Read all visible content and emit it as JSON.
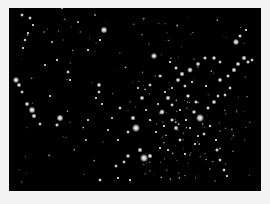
{
  "image": {
    "subject": "United States at night from space",
    "background_color": "#f4f4f4",
    "photo_color": "#000000",
    "light_color": "#ffffff"
  },
  "lights": [
    [
      22,
      15,
      1.2
    ],
    [
      30,
      18,
      1.2
    ],
    [
      33,
      25,
      1.0
    ],
    [
      28,
      33,
      1.0
    ],
    [
      25,
      40,
      1.1
    ],
    [
      23,
      48,
      1.0
    ],
    [
      16,
      80,
      2.0
    ],
    [
      19,
      85,
      1.5
    ],
    [
      22,
      92,
      1.2
    ],
    [
      27,
      104,
      1.5
    ],
    [
      32,
      110,
      2.2
    ],
    [
      34,
      116,
      1.6
    ],
    [
      40,
      124,
      1.2
    ],
    [
      60,
      118,
      2.2
    ],
    [
      57,
      125,
      1.3
    ],
    [
      50,
      96,
      1.0
    ],
    [
      45,
      65,
      0.9
    ],
    [
      57,
      60,
      1.0
    ],
    [
      52,
      42,
      0.8
    ],
    [
      104,
      30,
      2.2
    ],
    [
      100,
      40,
      1.0
    ],
    [
      78,
      22,
      0.8
    ],
    [
      95,
      15,
      0.7
    ],
    [
      62,
      8,
      0.8
    ],
    [
      88,
      50,
      1.0
    ],
    [
      68,
      72,
      1.2
    ],
    [
      70,
      80,
      1.0
    ],
    [
      99,
      85,
      1.5
    ],
    [
      99,
      92,
      1.2
    ],
    [
      96,
      98,
      1.0
    ],
    [
      88,
      120,
      1.0
    ],
    [
      86,
      140,
      0.8
    ],
    [
      102,
      104,
      1.0
    ],
    [
      120,
      108,
      1.2
    ],
    [
      133,
      118,
      1.6
    ],
    [
      136,
      128,
      2.6
    ],
    [
      128,
      132,
      1.2
    ],
    [
      150,
      85,
      1.2
    ],
    [
      142,
      98,
      1.5
    ],
    [
      154,
      56,
      2.0
    ],
    [
      170,
      62,
      1.0
    ],
    [
      176,
      68,
      1.3
    ],
    [
      182,
      74,
      1.6
    ],
    [
      190,
      70,
      1.8
    ],
    [
      198,
      64,
      1.5
    ],
    [
      205,
      58,
      1.3
    ],
    [
      178,
      80,
      1.5
    ],
    [
      185,
      86,
      1.2
    ],
    [
      168,
      98,
      1.6
    ],
    [
      172,
      105,
      1.2
    ],
    [
      162,
      112,
      1.8
    ],
    [
      172,
      120,
      1.3
    ],
    [
      176,
      128,
      1.6
    ],
    [
      188,
      96,
      1.4
    ],
    [
      196,
      102,
      1.3
    ],
    [
      194,
      112,
      1.4
    ],
    [
      200,
      118,
      2.6
    ],
    [
      208,
      108,
      1.3
    ],
    [
      214,
      102,
      1.5
    ],
    [
      218,
      96,
      1.2
    ],
    [
      186,
      120,
      1.0
    ],
    [
      180,
      140,
      1.2
    ],
    [
      168,
      150,
      1.0
    ],
    [
      160,
      148,
      1.0
    ],
    [
      150,
      156,
      1.6
    ],
    [
      140,
      150,
      1.6
    ],
    [
      144,
      158,
      2.6
    ],
    [
      128,
      156,
      1.4
    ],
    [
      124,
      162,
      1.2
    ],
    [
      116,
      166,
      1.2
    ],
    [
      130,
      180,
      1.0
    ],
    [
      118,
      178,
      1.0
    ],
    [
      100,
      180,
      1.2
    ],
    [
      217,
      150,
      1.3
    ],
    [
      220,
      160,
      1.2
    ],
    [
      224,
      170,
      1.2
    ],
    [
      227,
      176,
      1.0
    ],
    [
      216,
      140,
      1.0
    ],
    [
      220,
      80,
      1.5
    ],
    [
      228,
      76,
      1.3
    ],
    [
      234,
      70,
      1.6
    ],
    [
      238,
      64,
      1.5
    ],
    [
      244,
      58,
      1.6
    ],
    [
      248,
      62,
      1.3
    ],
    [
      252,
      60,
      1.2
    ],
    [
      236,
      42,
      2.0
    ],
    [
      240,
      36,
      1.3
    ],
    [
      246,
      30,
      1.0
    ],
    [
      214,
      58,
      1.4
    ],
    [
      220,
      62,
      1.2
    ],
    [
      230,
      88,
      1.2
    ],
    [
      225,
      95,
      1.2
    ],
    [
      210,
      126,
      1.1
    ],
    [
      204,
      134,
      1.2
    ],
    [
      195,
      144,
      1.0
    ],
    [
      185,
      154,
      1.0
    ],
    [
      160,
      76,
      1.2
    ],
    [
      165,
      92,
      1.0
    ],
    [
      150,
      120,
      1.0
    ],
    [
      180,
      110,
      0.9
    ],
    [
      206,
      86,
      1.0
    ],
    [
      192,
      82,
      1.0
    ],
    [
      172,
      88,
      0.9
    ],
    [
      158,
      104,
      0.9
    ],
    [
      146,
      110,
      0.9
    ],
    [
      138,
      88,
      0.9
    ],
    [
      112,
      118,
      0.9
    ],
    [
      108,
      130,
      0.9
    ],
    [
      118,
      140,
      0.9
    ],
    [
      156,
      132,
      1.0
    ],
    [
      164,
      126,
      1.0
    ],
    [
      190,
      128,
      1.0
    ],
    [
      198,
      136,
      0.9
    ]
  ]
}
